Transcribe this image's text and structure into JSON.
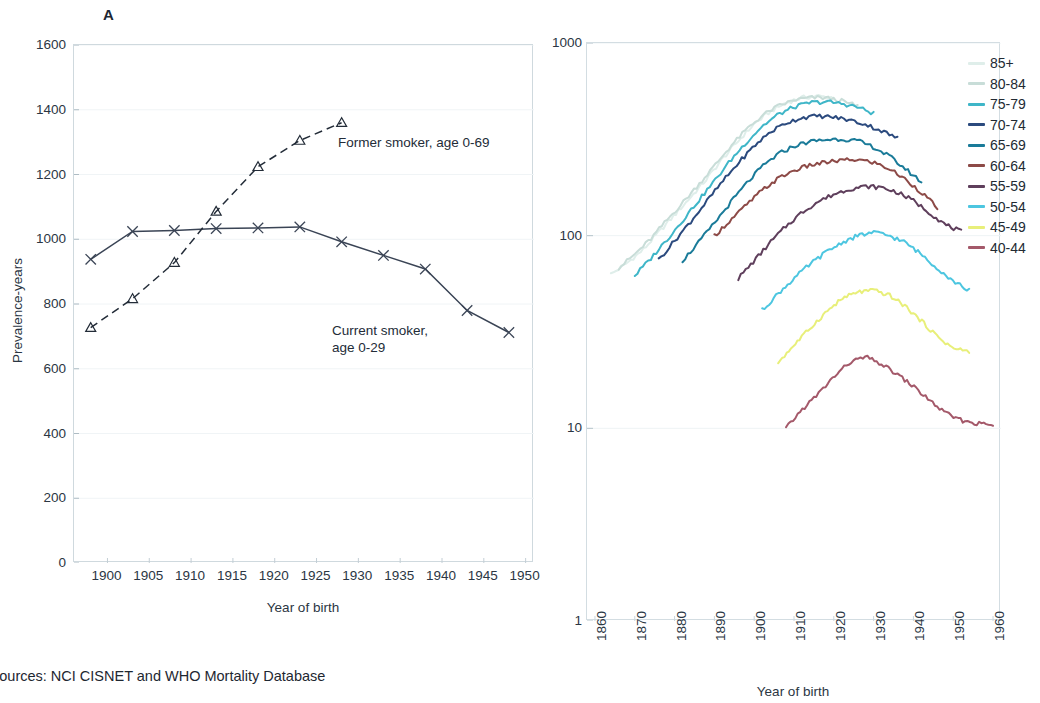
{
  "caption": "sources: NCI CISNET and WHO Mortality Database",
  "panel_a": {
    "letter": "A",
    "xlabel": "Year of birth",
    "ylabel": "Prevalence-years",
    "annotations": {
      "former": "Former smoker, age 0-69",
      "current": "Current smoker,\nage 0-29"
    }
  },
  "panel_b": {
    "letter": "B",
    "title": "Rate (per 100000)",
    "xlabel": "Year of birth"
  },
  "chart_data": [
    {
      "type": "line",
      "panel": "A",
      "title": "",
      "xlabel": "Year of birth",
      "ylabel": "Prevalence-years",
      "xlim": [
        1896,
        1951
      ],
      "ylim": [
        0,
        1600
      ],
      "xticks": [
        1900,
        1905,
        1910,
        1915,
        1920,
        1925,
        1930,
        1935,
        1940,
        1945,
        1950
      ],
      "yticks": [
        0,
        200,
        400,
        600,
        800,
        1000,
        1200,
        1400,
        1600
      ],
      "grid": "horizontal-faint",
      "legend": "inline-annotations",
      "series": [
        {
          "name": "Current smoker, age 0-29",
          "marker": "x",
          "linestyle": "solid",
          "color": "#3a4455",
          "x": [
            1898,
            1903,
            1908,
            1913,
            1918,
            1923,
            1928,
            1933,
            1938,
            1943,
            1948
          ],
          "values": [
            938,
            1024,
            1027,
            1033,
            1035,
            1038,
            992,
            950,
            908,
            780,
            712
          ]
        },
        {
          "name": "Former smoker, age 0-69",
          "marker": "triangle",
          "linestyle": "dashed",
          "color": "#232c38",
          "x": [
            1898,
            1903,
            1908,
            1913,
            1918,
            1923,
            1928
          ],
          "values": [
            727,
            816,
            928,
            1086,
            1224,
            1305,
            1360
          ]
        }
      ]
    },
    {
      "type": "line",
      "panel": "B",
      "title": "Rate (per 100000)",
      "xlabel": "Year of birth",
      "ylabel": "",
      "yscale": "log",
      "xlim": [
        1858,
        1962
      ],
      "ylim": [
        1,
        1000
      ],
      "xticks": [
        1860,
        1870,
        1880,
        1890,
        1900,
        1910,
        1920,
        1930,
        1940,
        1950,
        1960
      ],
      "yticks": [
        1,
        10,
        100,
        1000
      ],
      "grid": "horizontal-faint",
      "legend_position": "right",
      "series": [
        {
          "name": "85+",
          "color": "#dfeeea",
          "x": [
            1864,
            1868,
            1872,
            1876,
            1880,
            1884,
            1888,
            1892,
            1896,
            1900,
            1904,
            1908,
            1912,
            1916,
            1920
          ],
          "values": [
            63,
            72,
            84,
            104,
            128,
            158,
            196,
            250,
            310,
            380,
            440,
            490,
            520,
            530,
            520
          ]
        },
        {
          "name": "80-84",
          "color": "#c8ddd8",
          "x": [
            1866,
            1870,
            1874,
            1878,
            1882,
            1886,
            1890,
            1894,
            1898,
            1902,
            1906,
            1910,
            1914,
            1918,
            1922,
            1926
          ],
          "values": [
            68,
            80,
            96,
            120,
            148,
            184,
            230,
            290,
            355,
            420,
            470,
            505,
            520,
            520,
            500,
            470
          ]
        },
        {
          "name": "75-79",
          "color": "#3fb6c8",
          "x": [
            1870,
            1874,
            1878,
            1882,
            1886,
            1890,
            1894,
            1898,
            1902,
            1906,
            1910,
            1914,
            1918,
            1922,
            1926,
            1930
          ],
          "values": [
            62,
            76,
            95,
            120,
            152,
            192,
            245,
            305,
            370,
            425,
            465,
            490,
            495,
            485,
            465,
            430
          ]
        },
        {
          "name": "70-74",
          "color": "#2b4a7e",
          "x": [
            1876,
            1880,
            1884,
            1888,
            1892,
            1896,
            1900,
            1904,
            1908,
            1912,
            1916,
            1920,
            1924,
            1928,
            1932,
            1936
          ],
          "values": [
            75,
            94,
            118,
            150,
            190,
            238,
            292,
            345,
            385,
            410,
            418,
            412,
            398,
            378,
            350,
            320
          ]
        },
        {
          "name": "65-69",
          "color": "#1a7b99",
          "x": [
            1882,
            1886,
            1890,
            1894,
            1898,
            1902,
            1906,
            1910,
            1914,
            1918,
            1922,
            1926,
            1930,
            1934,
            1938,
            1942
          ],
          "values": [
            74,
            92,
            116,
            148,
            186,
            228,
            265,
            292,
            308,
            315,
            318,
            310,
            288,
            258,
            222,
            190
          ]
        },
        {
          "name": "60-64",
          "color": "#8d4a47",
          "x": [
            1890,
            1894,
            1898,
            1902,
            1906,
            1910,
            1914,
            1918,
            1922,
            1926,
            1930,
            1934,
            1938,
            1942,
            1946
          ],
          "values": [
            100,
            120,
            144,
            172,
            198,
            218,
            232,
            240,
            246,
            248,
            240,
            222,
            196,
            168,
            140
          ]
        },
        {
          "name": "55-59",
          "color": "#5f3f5c",
          "x": [
            1896,
            1900,
            1904,
            1908,
            1912,
            1916,
            1920,
            1924,
            1928,
            1932,
            1936,
            1940,
            1944,
            1948,
            1952
          ],
          "values": [
            60,
            74,
            92,
            112,
            132,
            150,
            164,
            175,
            180,
            178,
            168,
            152,
            132,
            114,
            105
          ]
        },
        {
          "name": "50-54",
          "color": "#4dc6e0",
          "x": [
            1902,
            1906,
            1910,
            1914,
            1918,
            1922,
            1926,
            1930,
            1934,
            1938,
            1942,
            1946,
            1950,
            1954
          ],
          "values": [
            41,
            50,
            60,
            71,
            82,
            92,
            100,
            104,
            100,
            92,
            80,
            68,
            58,
            52
          ]
        },
        {
          "name": "45-49",
          "color": "#e8ef7a",
          "x": [
            1906,
            1910,
            1914,
            1918,
            1922,
            1926,
            1930,
            1934,
            1938,
            1942,
            1946,
            1950,
            1954
          ],
          "values": [
            22,
            27,
            33,
            40,
            47,
            51,
            52,
            49,
            43,
            36,
            30,
            26,
            25
          ]
        },
        {
          "name": "40-44",
          "color": "#a4596a",
          "x": [
            1908,
            1912,
            1916,
            1920,
            1924,
            1928,
            1932,
            1936,
            1940,
            1944,
            1948,
            1952,
            1956,
            1960
          ],
          "values": [
            10.0,
            12.5,
            15.0,
            18.5,
            22.0,
            23.5,
            21.5,
            19.0,
            16.5,
            14.0,
            12.0,
            11.0,
            10.6,
            10.4
          ]
        }
      ]
    }
  ],
  "legend": {
    "items": [
      {
        "label": "85+",
        "color": "#dfeeea"
      },
      {
        "label": "80-84",
        "color": "#c8ddd8"
      },
      {
        "label": "75-79",
        "color": "#3fb6c8"
      },
      {
        "label": "70-74",
        "color": "#2b4a7e"
      },
      {
        "label": "65-69",
        "color": "#1a7b99"
      },
      {
        "label": "60-64",
        "color": "#8d4a47"
      },
      {
        "label": "55-59",
        "color": "#5f3f5c"
      },
      {
        "label": "50-54",
        "color": "#4dc6e0"
      },
      {
        "label": "45-49",
        "color": "#e8ef7a"
      },
      {
        "label": "40-44",
        "color": "#a4596a"
      }
    ]
  }
}
